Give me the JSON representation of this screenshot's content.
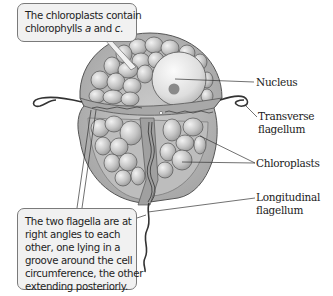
{
  "diagram": {
    "callouts": {
      "top": {
        "line1": "The chloroplasts contain",
        "line2_pre": "chlorophylls ",
        "line2_a": "a",
        "line2_mid": " and ",
        "line2_c": "c",
        "line2_post": "."
      },
      "bottom": {
        "lines": [
          "The two flagella are at",
          "right angles to each",
          "other, one lying in a",
          "groove around the cell",
          "circumference, the other",
          "extending posteriorly."
        ]
      }
    },
    "labels": {
      "nucleus": "Nucleus",
      "transverse_1": "Transverse",
      "transverse_2": "flagellum",
      "chloroplasts": "Chloroplasts",
      "longitudinal_1": "Longitudinal",
      "longitudinal_2": "flagellum"
    },
    "colors": {
      "cell_fill": "#b9b9b9",
      "cell_stroke": "#555555",
      "chloroplast_fill": "#c8c8c8",
      "nucleus_fill": "#e2e2e2",
      "nucleolus_fill": "#8a8a8a",
      "callout_fill": "#f1f1f1",
      "callout_border": "#7a7a7a"
    }
  }
}
